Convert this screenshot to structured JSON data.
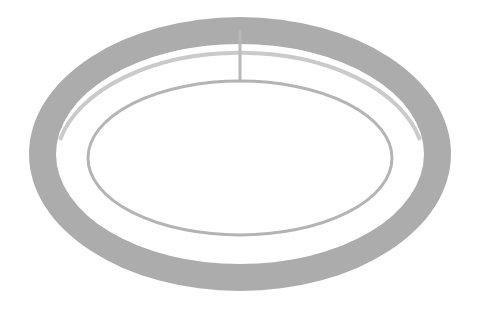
{
  "diagram": {
    "colors": {
      "background": "#ffffff",
      "ring": "#acacac",
      "ring_inner_wall": "#9f9f9f",
      "inner_ellipse": "#b4b4b4",
      "rod": "#b8b8b8"
    },
    "outer_ring": {
      "cx": 240,
      "cy": 154,
      "rx": 211,
      "ry": 137,
      "inner_rx": 184,
      "inner_ry": 110,
      "inner_cy": 154
    },
    "inner_ellipse": {
      "cx": 240,
      "cy": 158,
      "rx": 152,
      "ry": 77,
      "stroke_width": 3
    },
    "rod": {
      "x": 240,
      "y1": 31,
      "y2": 81,
      "width": 3
    }
  }
}
